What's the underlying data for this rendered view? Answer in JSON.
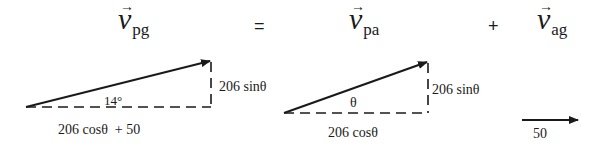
{
  "equation": {
    "term1": {
      "symbol": "v",
      "subscript": "pg",
      "arrow": "→"
    },
    "equals": "=",
    "term2": {
      "symbol": "v",
      "subscript": "pa",
      "arrow": "→"
    },
    "plus": "+",
    "term3": {
      "symbol": "v",
      "subscript": "ag",
      "arrow": "→"
    }
  },
  "triangle_pg": {
    "angle_label": "14°",
    "vertical_label": "206 sinθ",
    "horizontal_label": "206 cosθ  + 50"
  },
  "triangle_pa": {
    "angle_label": "θ",
    "vertical_label": "206 sinθ",
    "horizontal_label": "206 cosθ"
  },
  "vector_ag": {
    "magnitude_label": "50"
  },
  "colors": {
    "ink": "#1a1a1a",
    "background": "#ffffff"
  }
}
